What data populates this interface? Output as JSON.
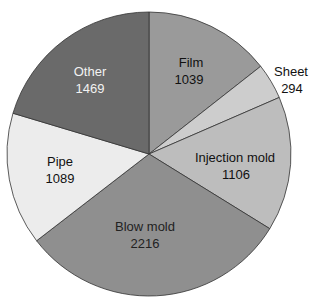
{
  "chart_data": {
    "type": "pie",
    "title": "",
    "categories": [
      "Film",
      "Sheet",
      "Injection mold",
      "Blow mold",
      "Pipe",
      "Other"
    ],
    "values": [
      1039,
      294,
      1106,
      2216,
      1089,
      1469
    ],
    "colors": [
      "#9a9a9a",
      "#cdcdcd",
      "#bdbdbd",
      "#8f8f8f",
      "#ececec",
      "#6a6a6a"
    ],
    "label_colors": [
      "#111111",
      "#111111",
      "#111111",
      "#222222",
      "#111111",
      "#f2f2f2"
    ],
    "start_angle": "12 o'clock",
    "direction": "clockwise",
    "legend": "none (inline labels)"
  },
  "labels": [
    {
      "name": "Film",
      "value": "1039"
    },
    {
      "name": "Sheet",
      "value": "294"
    },
    {
      "name": "Injection mold",
      "value": "1106"
    },
    {
      "name": "Blow mold",
      "value": "2216"
    },
    {
      "name": "Pipe",
      "value": "1089"
    },
    {
      "name": "Other",
      "value": "1469"
    }
  ]
}
